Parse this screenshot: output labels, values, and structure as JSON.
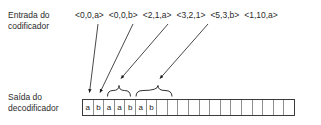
{
  "diagram": {
    "colors": {
      "background": "#ffffff",
      "text": "#2b2b2b",
      "box_border": "#3a3a3a",
      "cell_divider": "#8e8e8e",
      "arrow": "#1a1a1a",
      "brace": "#1a1a1a"
    }
  },
  "labels": {
    "encoder_input": "Entrada do codificador",
    "encoder_input_line1": "Entrada do",
    "encoder_input_line2": "codificador",
    "decoder_output": "Saída do decodificador",
    "decoder_output_line1": "Saída do",
    "decoder_output_line2": "decodificador"
  },
  "tuples": [
    {
      "text": "<0,0,a>"
    },
    {
      "text": "<0,0,b>"
    },
    {
      "text": "<2,1,a>"
    },
    {
      "text": "<3,2,1>"
    },
    {
      "text": "<5,3,b>"
    },
    {
      "text": "<1,10,a>"
    }
  ],
  "tape": {
    "total_cells": 20,
    "cells": [
      {
        "value": "a"
      },
      {
        "value": "b"
      },
      {
        "value": "a"
      },
      {
        "value": "a"
      },
      {
        "value": "b"
      },
      {
        "value": "a"
      },
      {
        "value": "b"
      },
      {
        "value": ""
      },
      {
        "value": ""
      },
      {
        "value": ""
      },
      {
        "value": ""
      },
      {
        "value": ""
      },
      {
        "value": ""
      },
      {
        "value": ""
      },
      {
        "value": ""
      },
      {
        "value": ""
      },
      {
        "value": ""
      },
      {
        "value": ""
      },
      {
        "value": ""
      },
      {
        "value": ""
      }
    ]
  },
  "arrows": [
    {
      "name": "arrow-tuple-1-to-cell-1",
      "from_tuple": "<0,0,a>",
      "to": "cell-1"
    },
    {
      "name": "arrow-tuple-2-to-cell-2",
      "from_tuple": "<0,0,b>",
      "to": "cell-2"
    },
    {
      "name": "arrow-tuple-3-to-brace-1",
      "from_tuple": "<2,1,a>",
      "to": "brace-cells-3-4"
    },
    {
      "name": "arrow-tuple-4-to-brace-2",
      "from_tuple": "<3,2,1>",
      "to": "brace-cells-5-7"
    }
  ],
  "braces": [
    {
      "name": "brace-cells-3-4",
      "spans_cells": "3-4"
    },
    {
      "name": "brace-cells-5-7",
      "spans_cells": "5-7"
    }
  ]
}
